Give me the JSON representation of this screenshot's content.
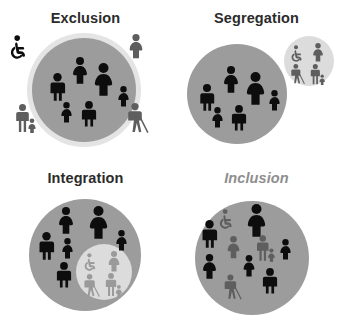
{
  "graphic": {
    "kind": "four-panel-inclusion-diagram",
    "background_color": "#ffffff",
    "colors": {
      "big_circle": "#9c9c9c",
      "small_circle": "#dcdcdc",
      "halo": "#e4e4e4",
      "figure_dark": "#0d0d0d",
      "figure_mid": "#5e5e5e",
      "figure_light": "#9a9a9a",
      "title_dark": "#2b2b2b",
      "title_muted": "#8e8e8e"
    }
  },
  "panels": [
    {
      "id": "exclusion",
      "title": "Exclusion",
      "title_style": "bold",
      "description": "One large gray circle holding six dark able-bodied figures; four gray disabled figures stand outside the circle",
      "inside_figures": [
        {
          "icon": "person-adult-man-icon",
          "tone": "dark"
        },
        {
          "icon": "person-adult-woman-icon",
          "tone": "dark"
        },
        {
          "icon": "person-adult-woman-large-icon",
          "tone": "dark"
        },
        {
          "icon": "person-child-icon",
          "tone": "dark"
        },
        {
          "icon": "person-child-icon",
          "tone": "dark"
        },
        {
          "icon": "person-child-icon",
          "tone": "dark"
        }
      ],
      "outside_figures": [
        {
          "icon": "wheelchair-user-icon",
          "tone": "dark",
          "position": "top-left"
        },
        {
          "icon": "person-adult-woman-icon",
          "tone": "mid",
          "position": "top-right"
        },
        {
          "icon": "person-with-child-icon",
          "tone": "mid",
          "position": "bottom-left"
        },
        {
          "icon": "person-with-cane-icon",
          "tone": "mid",
          "position": "bottom-right"
        }
      ]
    },
    {
      "id": "segregation",
      "title": "Segregation",
      "title_style": "bold",
      "description": "A large gray circle of dark able-bodied figures and a separate smaller light circle containing four gray disabled figures",
      "main_circle_figures": [
        {
          "icon": "person-adult-man-icon",
          "tone": "dark"
        },
        {
          "icon": "person-adult-woman-icon",
          "tone": "dark"
        },
        {
          "icon": "person-adult-woman-large-icon",
          "tone": "dark"
        },
        {
          "icon": "person-child-icon",
          "tone": "dark"
        },
        {
          "icon": "person-child-icon",
          "tone": "dark"
        },
        {
          "icon": "person-child-icon",
          "tone": "dark"
        }
      ],
      "small_circle_figures": [
        {
          "icon": "wheelchair-user-icon",
          "tone": "mid"
        },
        {
          "icon": "person-adult-woman-icon",
          "tone": "mid"
        },
        {
          "icon": "person-with-cane-icon",
          "tone": "mid"
        },
        {
          "icon": "person-with-child-icon",
          "tone": "mid"
        }
      ]
    },
    {
      "id": "integration",
      "title": "Integration",
      "title_style": "bold",
      "description": "A large gray circle of dark able-bodied figures containing a smaller light circle that keeps four gray disabled figures grouped apart",
      "main_circle_figures": [
        {
          "icon": "person-adult-woman-icon",
          "tone": "dark"
        },
        {
          "icon": "person-adult-woman-large-icon",
          "tone": "dark"
        },
        {
          "icon": "person-adult-man-icon",
          "tone": "dark"
        },
        {
          "icon": "person-child-icon",
          "tone": "dark"
        },
        {
          "icon": "person-child-icon",
          "tone": "dark"
        },
        {
          "icon": "person-adult-man-icon",
          "tone": "dark"
        }
      ],
      "inner_circle_figures": [
        {
          "icon": "wheelchair-user-icon",
          "tone": "light"
        },
        {
          "icon": "person-adult-woman-icon",
          "tone": "light"
        },
        {
          "icon": "person-with-cane-icon",
          "tone": "light"
        },
        {
          "icon": "person-with-child-icon",
          "tone": "light"
        }
      ]
    },
    {
      "id": "inclusion",
      "title": "Inclusion",
      "title_style": "italic-muted",
      "description": "A single gray circle in which dark able-bodied figures and gray disabled figures are mixed evenly together",
      "mixed_figures": [
        {
          "icon": "wheelchair-user-icon",
          "tone": "mid"
        },
        {
          "icon": "person-adult-woman-large-icon",
          "tone": "dark"
        },
        {
          "icon": "person-adult-man-icon",
          "tone": "dark"
        },
        {
          "icon": "person-adult-woman-icon",
          "tone": "mid"
        },
        {
          "icon": "person-with-child-icon",
          "tone": "mid"
        },
        {
          "icon": "person-child-icon",
          "tone": "dark"
        },
        {
          "icon": "person-adult-woman-icon",
          "tone": "dark"
        },
        {
          "icon": "person-child-icon",
          "tone": "dark"
        },
        {
          "icon": "person-with-cane-icon",
          "tone": "mid"
        },
        {
          "icon": "person-adult-man-icon",
          "tone": "dark"
        }
      ]
    }
  ]
}
